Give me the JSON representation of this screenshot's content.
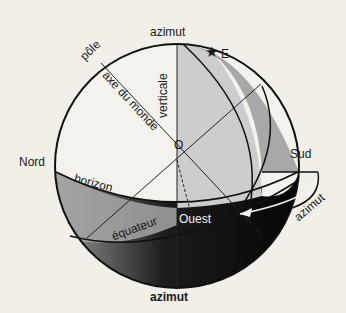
{
  "figure": {
    "labels": {
      "azimut_top": "azimut",
      "pole": "pôle",
      "axis": "axe du monde",
      "vertical": "verticale",
      "star": "E",
      "origin": "O",
      "north": "Nord",
      "south": "Sud",
      "horizon": "horizon",
      "equator": "équateur",
      "west": "Ouest",
      "azimut_arrow": "azimut",
      "caption": "azimut"
    },
    "icons": {
      "star": "★"
    },
    "colors": {
      "background": "#f1efe8",
      "sphere_fill": "#f3f1ec",
      "light_gray": "#c9c9c9",
      "mid_gray": "#a9a9a9",
      "dark": "#0a0a0a",
      "stroke": "#111111"
    }
  }
}
